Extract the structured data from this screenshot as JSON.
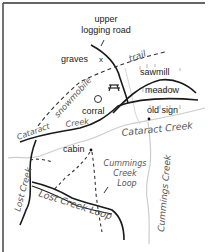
{
  "map": {
    "colors": {
      "road": "#1a1a1a",
      "trail": "#333333",
      "creek": "#c8c8c8",
      "frame": "#444444",
      "label": "#222222",
      "creek_label": "#555555"
    },
    "labels": {
      "upper_logging_road_line1": "upper",
      "upper_logging_road_line2": "logging road",
      "graves": "graves",
      "graves_marker": "x",
      "trail": "trail",
      "sawmill": "sawmill",
      "meadow": "meadow",
      "snowmobile": "snowmobile",
      "corral": "corral",
      "old_sign": "old sign",
      "cataract_creek_west": "Cataract",
      "cataract_creek_west_2": "Creek",
      "cataract_creek_east": "Cataract Creek",
      "cabin": "cabin",
      "cummings_creek_loop_line1": "Cummings",
      "cummings_creek_loop_line2": "Creek",
      "cummings_creek_loop_line3": "Loop",
      "lost_creek": "Lost Creek",
      "lost_creek_loop": "Lost Creek Loop",
      "cummings_creek": "Cummings Creek"
    },
    "icons": {
      "picnic_table": "picnic-table-icon",
      "corral_circle": "corral-circle-icon"
    }
  }
}
